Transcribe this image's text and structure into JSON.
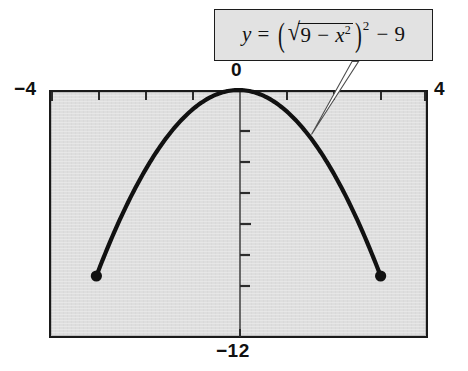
{
  "figure": {
    "equation_label": {
      "lhs": "y",
      "equals": "=",
      "radicand_a": "9",
      "radicand_minus": "−",
      "radicand_x": "x",
      "radicand_x_exp": "2",
      "paren_open": "(",
      "paren_close": ")",
      "paren_exp": "2",
      "tail_minus": "−",
      "tail_value": "9",
      "plain": "y = (√(9 − x²))² − 9"
    },
    "axis_labels": {
      "x_min": "−4",
      "x_max": "4",
      "y_max": "0",
      "y_min": "−12"
    },
    "colors": {
      "plot_fill": "#dedede",
      "frame_border": "#1a1a1a",
      "curve": "#111111",
      "callout_fill": "#e2e2e2",
      "callout_border": "#1c1c1c",
      "page_background": "#ffffff"
    }
  },
  "chart_data": {
    "type": "line",
    "title": "",
    "subtitle": "",
    "xlabel": "",
    "ylabel": "",
    "xlim": [
      -4,
      4
    ],
    "ylim": [
      -12,
      0
    ],
    "grid": false,
    "legend": "none",
    "annotations": [
      {
        "text": "y = (√(9 − x²))² − 9",
        "kind": "callout-box",
        "points_to_x": 1.45,
        "points_to_y": -1.9
      }
    ],
    "x_ticks": [
      -4,
      -3,
      -2,
      -1,
      0,
      1,
      2,
      3,
      4
    ],
    "x_tick_labels": [
      "−4",
      "",
      "",
      "",
      "0",
      "",
      "",
      "",
      "4"
    ],
    "y_ticks": [
      -12,
      -10.5,
      -9,
      -7.5,
      -6,
      -4.5,
      -3,
      -1.5,
      0
    ],
    "y_tick_labels": [
      "−12",
      "",
      "",
      "",
      "",
      "",
      "",
      "",
      "0"
    ],
    "series": [
      {
        "name": "y = (√(9 − x²))² − 9",
        "domain": [
          -3,
          3
        ],
        "x": [
          -3,
          -2.75,
          -2.5,
          -2.25,
          -2,
          -1.75,
          -1.5,
          -1.25,
          -1,
          -0.75,
          -0.5,
          -0.25,
          0,
          0.25,
          0.5,
          0.75,
          1,
          1.25,
          1.5,
          1.75,
          2,
          2.25,
          2.5,
          2.75,
          3
        ],
        "values": [
          -9,
          -7.5625,
          -6.25,
          -5.0625,
          -4,
          -3.0625,
          -2.25,
          -1.5625,
          -1,
          -0.5625,
          -0.25,
          -0.0625,
          0,
          -0.0625,
          -0.25,
          -0.5625,
          -1,
          -1.5625,
          -2.25,
          -3.0625,
          -4,
          -5.0625,
          -6.25,
          -7.5625,
          -9
        ]
      }
    ],
    "endpoints": [
      {
        "x": -3,
        "y": -9,
        "style": "filled-dot"
      },
      {
        "x": 3,
        "y": -9,
        "style": "filled-dot"
      }
    ]
  }
}
